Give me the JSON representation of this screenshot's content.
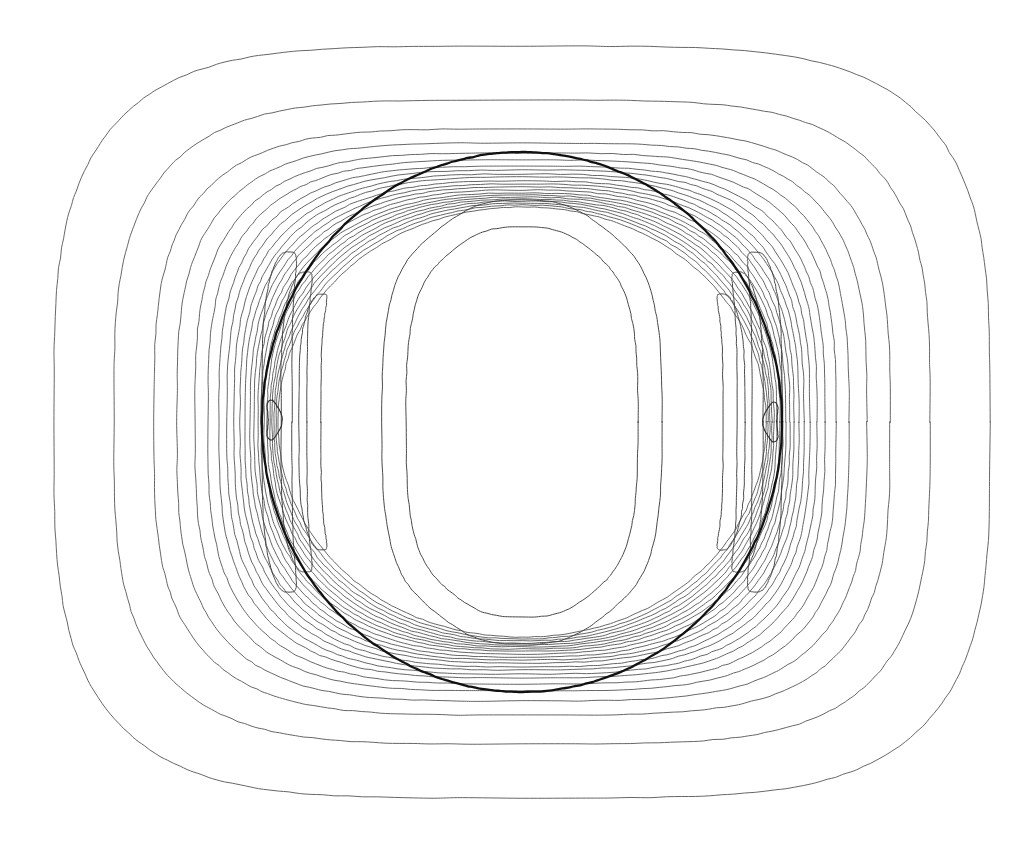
{
  "figure": {
    "kind": "contour-plot",
    "background_color": "#ffffff",
    "line_color": "#4a4a4a",
    "boundary_color": "#111111",
    "width": 1030,
    "height": 841
  },
  "chart_data": {
    "type": "line",
    "plot_kind": "contour",
    "title": "",
    "subtitle": "",
    "xlabel": "",
    "ylabel": "",
    "grid": false,
    "legend": null,
    "axes_visible": false,
    "tick_labels_x": [],
    "tick_labels_y": [],
    "xlim": [
      0,
      1030
    ],
    "ylim": [
      0,
      841
    ],
    "symmetry": [
      "left-right mirror",
      "top-bottom mirror"
    ],
    "center": [
      522,
      422
    ],
    "body": {
      "name": "circular-boundary",
      "shape": "circle",
      "center_x": 522,
      "center_y": 422,
      "radius_x": 260,
      "radius_y": 270,
      "stroke_width": 2.3,
      "stroke": "#111111"
    },
    "contour_levels_outside": 22,
    "contour_levels_inside": 6,
    "closed_extrema": [
      {
        "label": "left-extremum",
        "x": 272,
        "y": 420,
        "rx": 7,
        "ry": 20
      },
      {
        "label": "right-extremum",
        "x": 773,
        "y": 422,
        "rx": 7,
        "ry": 20
      }
    ],
    "outer_contours": [
      {
        "index": 1,
        "half_width": 468,
        "half_height": 385,
        "corner_roundness": 0.62
      },
      {
        "index": 2,
        "half_width": 408,
        "half_height": 330,
        "corner_roundness": 0.6
      },
      {
        "index": 3,
        "half_width": 368,
        "half_height": 300,
        "corner_roundness": 0.58
      },
      {
        "index": 4,
        "half_width": 345,
        "half_height": 285,
        "corner_roundness": 0.56
      },
      {
        "index": 5,
        "half_width": 327,
        "half_height": 274,
        "corner_roundness": 0.54
      },
      {
        "index": 6,
        "half_width": 314,
        "half_height": 266,
        "corner_roundness": 0.52
      },
      {
        "index": 7,
        "half_width": 303,
        "half_height": 259,
        "corner_roundness": 0.5
      },
      {
        "index": 8,
        "half_width": 295,
        "half_height": 254,
        "corner_roundness": 0.48
      },
      {
        "index": 9,
        "half_width": 288,
        "half_height": 249,
        "corner_roundness": 0.46
      },
      {
        "index": 10,
        "half_width": 282,
        "half_height": 245,
        "corner_roundness": 0.44
      },
      {
        "index": 11,
        "half_width": 277,
        "half_height": 241,
        "corner_roundness": 0.42
      },
      {
        "index": 12,
        "half_width": 272,
        "half_height": 238,
        "corner_roundness": 0.4
      },
      {
        "index": 13,
        "half_width": 268,
        "half_height": 235,
        "corner_roundness": 0.38
      },
      {
        "index": 14,
        "half_width": 264,
        "half_height": 232,
        "corner_roundness": 0.36
      },
      {
        "index": 15,
        "half_width": 261,
        "half_height": 229,
        "corner_roundness": 0.34
      },
      {
        "index": 16,
        "half_width": 258,
        "half_height": 227,
        "corner_roundness": 0.32
      },
      {
        "index": 17,
        "half_width": 255,
        "half_height": 225,
        "corner_roundness": 0.3
      },
      {
        "index": 18,
        "half_width": 252,
        "half_height": 223,
        "corner_roundness": 0.28
      },
      {
        "index": 19,
        "half_width": 250,
        "half_height": 221,
        "corner_roundness": 0.26
      },
      {
        "index": 20,
        "half_width": 248,
        "half_height": 219,
        "corner_roundness": 0.24
      },
      {
        "index": 21,
        "half_width": 246,
        "half_height": 217,
        "corner_roundness": 0.22
      },
      {
        "index": 22,
        "half_width": 244,
        "half_height": 215,
        "corner_roundness": 0.2
      }
    ],
    "inner_lobes": [
      {
        "index": 1,
        "offset_from_center": 245,
        "half_height": 170,
        "width": 30
      },
      {
        "index": 2,
        "offset_from_center": 228,
        "half_height": 150,
        "width": 26
      },
      {
        "index": 3,
        "offset_from_center": 212,
        "half_height": 128,
        "width": 22
      }
    ]
  }
}
